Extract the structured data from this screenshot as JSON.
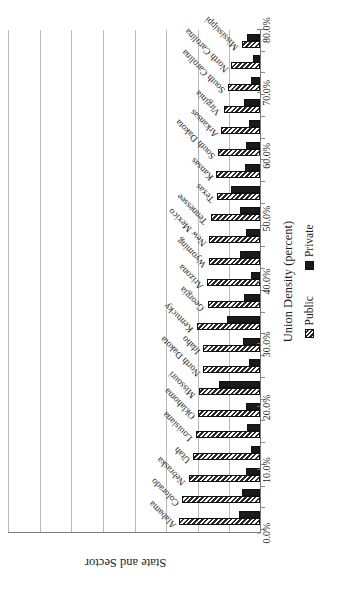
{
  "chart_data": {
    "type": "bar",
    "orientation": "vertical-rotated",
    "title": "",
    "xlabel": "State and Sector",
    "ylabel": "Union Density (percent)",
    "axis_titles": {
      "value_axis": "Union Density (percent)",
      "category_axis": "State and Sector"
    },
    "ylim": [
      0,
      80
    ],
    "y_major_step": 10,
    "grid": true,
    "legend_position": "bottom",
    "tick_labels": [
      "0.0%",
      "10.0%",
      "20.0%",
      "30.0%",
      "40.0%",
      "50.0%",
      "60.0%",
      "70.0%",
      "80.0%"
    ],
    "tick_values": [
      0,
      10,
      20,
      30,
      40,
      50,
      60,
      70,
      80
    ],
    "categories": [
      "Alabama",
      "Colorado",
      "Nebraska",
      "Utah",
      "Louisiana",
      "Oklahoma",
      "Missouri",
      "North Dakota",
      "Idaho",
      "Kentucky",
      "Georgia",
      "Arizona",
      "Wyoming",
      "New Mexico",
      "Tennessee",
      "Texas",
      "Kansas",
      "South Dakota",
      "Arkansas",
      "Virginia",
      "South Carolina",
      "North Carolina",
      "Mississippi"
    ],
    "series": [
      {
        "name": "Public",
        "fill": "diagonal-hatch",
        "color": "#2a2a2a",
        "values": [
          25.6,
          24.6,
          22.6,
          21.1,
          20.3,
          19.6,
          19.4,
          18.0,
          17.9,
          20.0,
          16.6,
          16.9,
          16.0,
          16.0,
          15.5,
          13.5,
          13.8,
          13.2,
          12.2,
          11.5,
          10.1,
          9.1,
          5.7
        ]
      },
      {
        "name": "Private",
        "fill": "solid",
        "color": "#1a1a1a",
        "values": [
          6.8,
          5.7,
          4.3,
          3.0,
          4.0,
          4.5,
          12.9,
          3.6,
          5.5,
          10.4,
          5.2,
          2.8,
          6.2,
          4.5,
          6.2,
          9.2,
          4.7,
          4.5,
          3.6,
          5.0,
          3.0,
          2.2,
          4.1
        ]
      }
    ]
  },
  "legend": {
    "items": [
      {
        "label": "Public"
      },
      {
        "label": "Private"
      }
    ]
  },
  "colors": {
    "public": "#2a2a2a",
    "private": "#1a1a1a",
    "grid": "#b9b9b9",
    "axis": "#7a7a7a",
    "background": "#ffffff"
  }
}
